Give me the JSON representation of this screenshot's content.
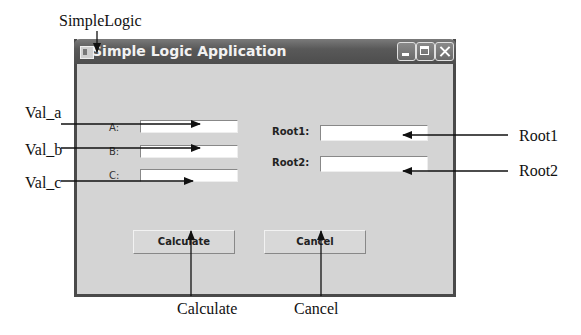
{
  "window": {
    "title": "Simple Logic Application",
    "controls": [
      "minimize",
      "maximize",
      "close"
    ]
  },
  "form": {
    "inputs": [
      {
        "label": "A:",
        "value": ""
      },
      {
        "label": "B:",
        "value": ""
      },
      {
        "label": "C:",
        "value": ""
      }
    ],
    "outputs": [
      {
        "label": "Root1:",
        "value": ""
      },
      {
        "label": "Root2:",
        "value": ""
      }
    ],
    "buttons": {
      "calculate": "Calculate",
      "cancel": "Cancel"
    }
  },
  "annotations": {
    "window": "SimpleLogic",
    "val_a": "Val_a",
    "val_b": "Val_b",
    "val_c": "Val_c",
    "root1": "Root1",
    "root2": "Root2",
    "calculate": "Calculate",
    "cancel": "Cancel"
  }
}
